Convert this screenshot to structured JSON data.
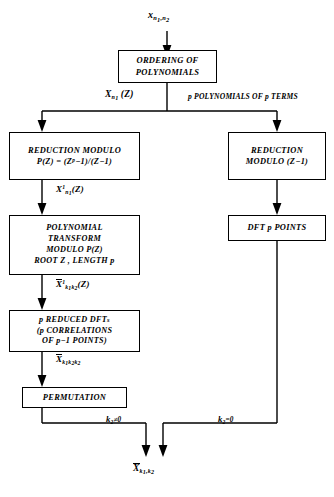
{
  "figure": {
    "background": "#ffffff",
    "stroke": "#000000"
  },
  "nodes": {
    "ordering": {
      "line1": "ORDERING OF",
      "line2": "POLYNOMIALS"
    },
    "reduction_modulo_pz": {
      "line1": "REDUCTION MODULO",
      "line2_prefix": "P(Z)  =   (Z",
      "line2_sup": "p",
      "line2_suffix": "−1)/(Z−1)"
    },
    "polynomial_transform": {
      "line1": "POLYNOMIAL",
      "line2": "TRANSFORM",
      "line3": "MODULO  P(Z)",
      "line4": "ROOT Z  ,   LENGTH p"
    },
    "reduced_dfts": {
      "line1_a": "p REDUCED DFT",
      "line1_b": "s",
      "line2": "(p CORRELATIONS",
      "line3_a": "OF p",
      "line3_b": "−1 POINTS)"
    },
    "permutation": {
      "line1": "PERMUTATION"
    },
    "reduction_modulo_z1": {
      "line1": "REDUCTION",
      "line2": "MODULO  (Z−1)"
    },
    "dft_p_points": {
      "line1": "DFT  p  POINTS"
    }
  },
  "edge_labels": {
    "input": {
      "base": "x",
      "sub1": "n",
      "sub1sub": "1",
      "sub2": ",n",
      "sub2sub": "2"
    },
    "left_branch": {
      "base": "X",
      "sub": "n",
      "subsub": "1",
      "tail": "(Z)"
    },
    "right_branch": {
      "text": "p POLYNOMIALS OF p TERMS"
    },
    "after_reduction": {
      "base": "X",
      "sup": "1",
      "sub": "n",
      "subsub": "1",
      "tail": "(Z)"
    },
    "after_transform": {
      "base": "X",
      "sup": "1",
      "sub1": "k",
      "sub1sub": "1",
      "sub2": "k",
      "sub2sub": "2",
      "tail": "(Z)"
    },
    "after_dfts": {
      "base": "X",
      "sub1": "k",
      "sub1sub": "1",
      "sub2": "k",
      "sub2sub": "2",
      "sub3": "k",
      "sub3sub": "2"
    },
    "cond_left": {
      "base": "k",
      "sub": "2",
      "rel": "≠0"
    },
    "cond_right": {
      "base": "k",
      "sub": "2",
      "rel": "=0"
    },
    "output": {
      "base": "X",
      "sub1": "k",
      "sub1sub": "1",
      "sep": ",k",
      "sub2sub": "2"
    }
  }
}
